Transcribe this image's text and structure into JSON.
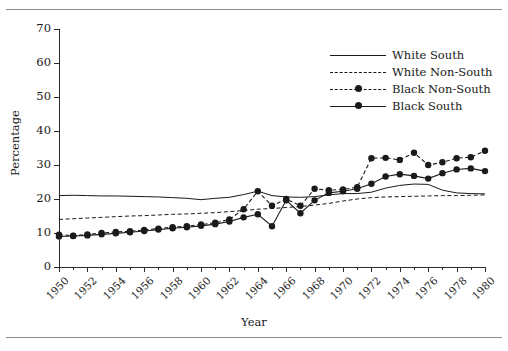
{
  "figure": {
    "clipped_caption_text": "· · · ·",
    "axis_title_x": "Year",
    "axis_title_y": "Percentage"
  },
  "legend": {
    "position": "upper-right",
    "items": [
      {
        "label": "White South",
        "style": "solid",
        "marker": false
      },
      {
        "label": "White Non-South",
        "style": "dashed",
        "marker": false
      },
      {
        "label": "Black Non-South",
        "style": "dashed",
        "marker": true
      },
      {
        "label": "Black South",
        "style": "solid",
        "marker": true
      }
    ]
  },
  "axes": {
    "y_ticks": [
      0,
      10,
      20,
      30,
      40,
      50,
      60,
      70
    ],
    "y_tick_labels": [
      "0",
      "10",
      "20",
      "30",
      "40",
      "50",
      "60",
      "70"
    ],
    "x_tick_labels": [
      "1950",
      "1952",
      "1954",
      "1956",
      "1958",
      "1960",
      "1962",
      "1964",
      "1966",
      "1968",
      "1970",
      "1972",
      "1974",
      "1976",
      "1978",
      "1980"
    ],
    "x_minor_step_years": 1
  },
  "chart_data": {
    "type": "line",
    "title": "",
    "subtitle": "",
    "xlabel": "Year",
    "ylabel": "Percentage",
    "xlim": [
      1950,
      1980
    ],
    "ylim": [
      0,
      70
    ],
    "ytick_step": 10,
    "xtick_step": 2,
    "grid": false,
    "legend_position": "upper-right",
    "x": [
      1950,
      1951,
      1952,
      1953,
      1954,
      1955,
      1956,
      1957,
      1958,
      1959,
      1960,
      1961,
      1962,
      1963,
      1964,
      1965,
      1966,
      1967,
      1968,
      1969,
      1970,
      1971,
      1972,
      1973,
      1974,
      1975,
      1976,
      1977,
      1978,
      1979,
      1980
    ],
    "series": [
      {
        "name": "White South",
        "style": "solid",
        "marker": false,
        "color": "#1a1a1a",
        "values": [
          21.0,
          21.1,
          21.0,
          20.9,
          20.9,
          20.8,
          20.7,
          20.6,
          20.4,
          20.2,
          19.8,
          20.2,
          20.5,
          21.3,
          22.3,
          21.0,
          20.6,
          20.5,
          20.7,
          21.2,
          21.6,
          21.6,
          22.0,
          23.2,
          24.0,
          24.4,
          24.3,
          22.6,
          21.8,
          21.6,
          21.5
        ]
      },
      {
        "name": "White Non-South",
        "style": "dashed",
        "marker": false,
        "color": "#1a1a1a",
        "values": [
          14.0,
          14.2,
          14.4,
          14.6,
          14.8,
          15.0,
          15.1,
          15.3,
          15.5,
          15.6,
          15.8,
          16.0,
          16.3,
          16.6,
          17.0,
          17.2,
          17.5,
          17.8,
          18.2,
          18.7,
          19.4,
          20.0,
          20.4,
          20.6,
          20.7,
          20.8,
          20.9,
          21.0,
          21.0,
          21.1,
          21.2
        ]
      },
      {
        "name": "Black Non-South",
        "style": "dashed",
        "marker": true,
        "color": "#1a1a1a",
        "values": [
          9.5,
          9.2,
          9.6,
          10.0,
          10.3,
          10.5,
          10.9,
          11.3,
          11.7,
          12.0,
          12.5,
          13.0,
          14.0,
          17.0,
          22.3,
          18.0,
          20.0,
          18.0,
          23.0,
          22.6,
          22.8,
          23.5,
          32.0,
          32.1,
          31.5,
          33.6,
          30.0,
          30.8,
          32.0,
          32.3,
          34.2
        ]
      },
      {
        "name": "Black South",
        "style": "solid",
        "marker": true,
        "color": "#1a1a1a",
        "values": [
          9.0,
          9.1,
          9.3,
          9.6,
          9.9,
          10.2,
          10.6,
          11.0,
          11.4,
          11.7,
          12.1,
          12.6,
          13.4,
          14.6,
          15.5,
          12.0,
          19.6,
          15.8,
          19.6,
          21.8,
          22.3,
          23.0,
          24.5,
          26.6,
          27.3,
          26.8,
          26.0,
          27.6,
          28.7,
          29.0,
          28.2
        ]
      }
    ]
  }
}
